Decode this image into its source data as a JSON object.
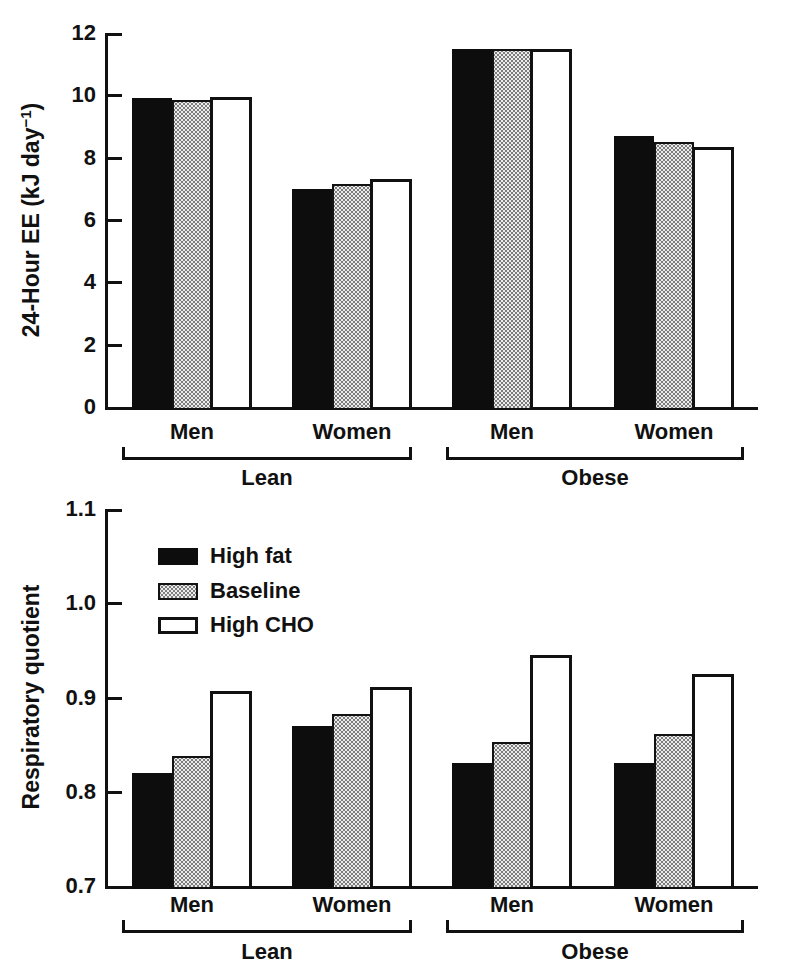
{
  "figure": {
    "description": "Two stacked grouped bar charts comparing diet conditions in lean and obese men and women",
    "background": "#ffffff"
  },
  "chart_data": [
    {
      "type": "bar",
      "title": "",
      "xlabel": "",
      "ylabel": "24-Hour EE (kJ day⁻¹)",
      "ylabel_parts": {
        "pre": "24-Hour EE (kJ day",
        "sup": "−1",
        "post": ")"
      },
      "ylim": [
        0,
        12
      ],
      "grid": false,
      "legend_shown": false,
      "yticks": [
        {
          "v": 0,
          "label": "0"
        },
        {
          "v": 2,
          "label": "2"
        },
        {
          "v": 4,
          "label": "4"
        },
        {
          "v": 6,
          "label": "6"
        },
        {
          "v": 8,
          "label": "8"
        },
        {
          "v": 10,
          "label": "10"
        },
        {
          "v": 12,
          "label": "12"
        }
      ],
      "groups": [
        {
          "label": "Lean",
          "categories": [
            "Men",
            "Women"
          ]
        },
        {
          "label": "Obese",
          "categories": [
            "Men",
            "Women"
          ]
        }
      ],
      "category_order": [
        "Lean Men",
        "Lean Women",
        "Obese Men",
        "Obese Women"
      ],
      "series": [
        {
          "name": "High fat",
          "fill": "black",
          "values": [
            9.9,
            7.0,
            11.5,
            8.7
          ]
        },
        {
          "name": "Baseline",
          "fill": "stipple",
          "values": [
            9.85,
            7.15,
            11.5,
            8.5
          ]
        },
        {
          "name": "High CHO",
          "fill": "white",
          "values": [
            9.95,
            7.3,
            11.5,
            8.35
          ]
        }
      ]
    },
    {
      "type": "bar",
      "title": "",
      "xlabel": "",
      "ylabel": "Respiratory quotient",
      "ylim": [
        0.7,
        1.1
      ],
      "grid": false,
      "legend_shown": true,
      "yticks": [
        {
          "v": 0.7,
          "label": "0.7"
        },
        {
          "v": 0.8,
          "label": "0.8"
        },
        {
          "v": 0.9,
          "label": "0.9"
        },
        {
          "v": 1.0,
          "label": "1.0"
        },
        {
          "v": 1.1,
          "label": "1.1"
        }
      ],
      "groups": [
        {
          "label": "Lean",
          "categories": [
            "Men",
            "Women"
          ]
        },
        {
          "label": "Obese",
          "categories": [
            "Men",
            "Women"
          ]
        }
      ],
      "category_order": [
        "Lean Men",
        "Lean Women",
        "Obese Men",
        "Obese Women"
      ],
      "series": [
        {
          "name": "High fat",
          "fill": "black",
          "values": [
            0.82,
            0.87,
            0.83,
            0.831
          ]
        },
        {
          "name": "Baseline",
          "fill": "stipple",
          "values": [
            0.838,
            0.883,
            0.853,
            0.861
          ]
        },
        {
          "name": "High CHO",
          "fill": "white",
          "values": [
            0.907,
            0.911,
            0.945,
            0.925
          ]
        }
      ],
      "legend": {
        "position": "top-left",
        "entries": [
          {
            "label": "High fat",
            "fill": "black"
          },
          {
            "label": "Baseline",
            "fill": "stipple"
          },
          {
            "label": "High CHO",
            "fill": "white"
          }
        ]
      }
    }
  ],
  "colors": {
    "ink": "#111111",
    "bar_black": "#0d0d0d",
    "bar_white": "#ffffff",
    "stipple_dot": "#7d7d7d",
    "stipple_bg": "#ececec",
    "background": "#ffffff"
  }
}
